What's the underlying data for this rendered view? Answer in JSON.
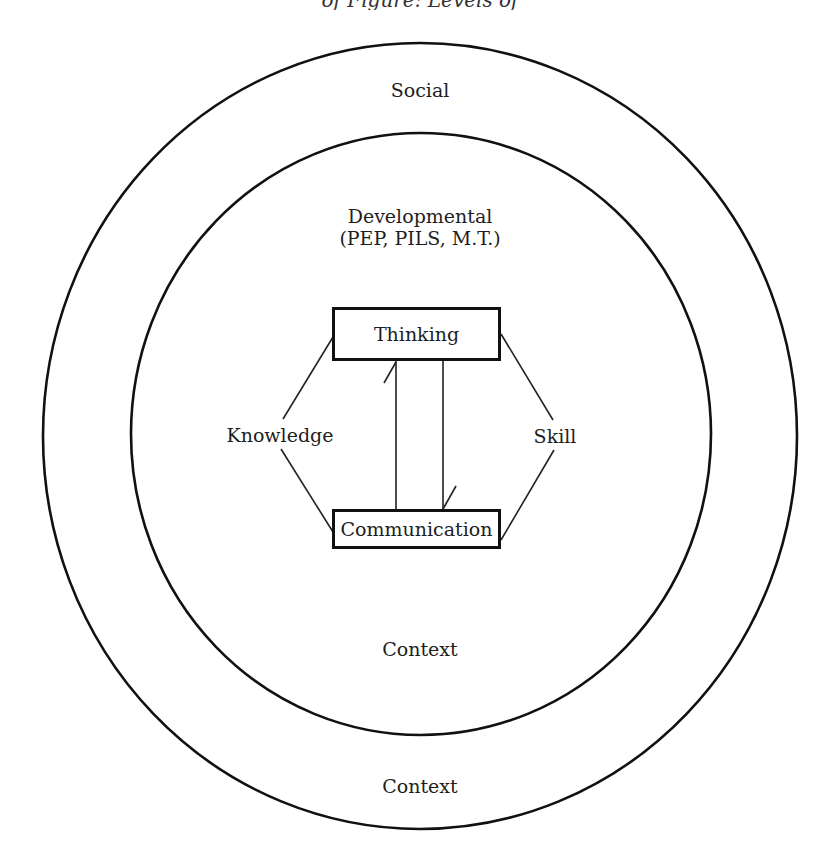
{
  "header": {
    "fragment_text": "of Figure: Levels of Difference"
  },
  "diagram": {
    "outer_circle": {
      "label_top": "Social",
      "label_bottom": "Context"
    },
    "inner_circle": {
      "label_top_line1": "Developmental",
      "label_top_line2": "(PEP, PILS, M.T.)",
      "label_bottom": "Context"
    },
    "nodes": {
      "thinking": "Thinking",
      "communication": "Communication",
      "knowledge": "Knowledge",
      "skill": "Skill"
    },
    "edges": [
      {
        "from": "thinking",
        "to": "knowledge",
        "type": "line"
      },
      {
        "from": "knowledge",
        "to": "communication",
        "type": "line"
      },
      {
        "from": "thinking",
        "to": "skill",
        "type": "line"
      },
      {
        "from": "skill",
        "to": "communication",
        "type": "line"
      },
      {
        "from": "communication",
        "to": "thinking",
        "type": "arrow"
      },
      {
        "from": "thinking",
        "to": "communication",
        "type": "arrow"
      }
    ],
    "stroke_color": "#111111"
  }
}
